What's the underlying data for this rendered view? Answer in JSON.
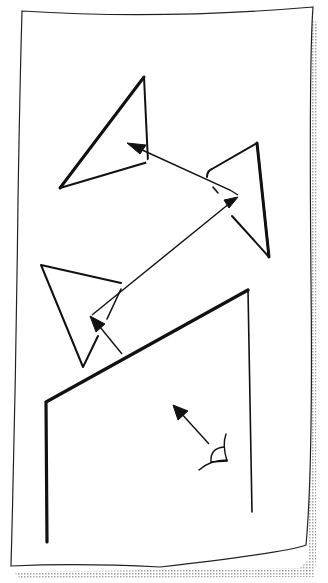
{
  "diagram": {
    "type": "hand-drawn sketch",
    "colors": {
      "ink": "#111111",
      "paper": "#ffffff",
      "shadow": "#9a9a9a"
    },
    "elements": [
      {
        "id": "eye",
        "label": "eye"
      },
      {
        "id": "wall",
        "label": "wall-corner"
      },
      {
        "id": "frustum-1",
        "label": "triangle-lower-left"
      },
      {
        "id": "frustum-2",
        "label": "triangle-right"
      },
      {
        "id": "frustum-3",
        "label": "triangle-top"
      }
    ]
  }
}
